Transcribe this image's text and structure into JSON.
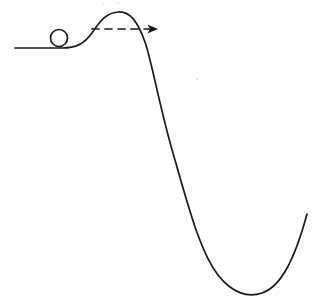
{
  "figure": {
    "title": "Ball rolling over a potential energy hill into a well",
    "background_color": "#ffffff",
    "ink_color": "#1a1a1a",
    "width": 319,
    "height": 303
  },
  "elements": {
    "ground_line": {
      "label": "flat ground",
      "start": [
        15,
        48
      ],
      "end": [
        62,
        48
      ],
      "stroke_width": 1.7
    },
    "terrain_curve": {
      "label": "hill and valley profile",
      "stroke_width": 1.7,
      "path": "M 15,48 L 62,48 C 76,48 84,44 92,33 C 100,21 106,13 118,12 C 130,11 138,22 145,42 C 152,62 160,110 175,160 C 188,205 200,252 218,275 C 232,293 248,298 262,293 C 280,287 294,262 307,214"
    },
    "ball": {
      "label": "ball",
      "center": [
        59,
        38
      ],
      "radius": 8.5,
      "stroke_width": 1.7,
      "fill": "#ffffff"
    },
    "motion_arrow": {
      "label": "direction of motion",
      "style": "dashed",
      "dash_pattern": "7 6",
      "start": [
        92,
        29
      ],
      "end": [
        163,
        29
      ],
      "stroke_width": 1.7,
      "arrowhead_size": 6
    },
    "peak": {
      "label": "hill crest",
      "point": [
        118,
        12
      ]
    },
    "valley": {
      "label": "valley floor",
      "point": [
        242,
        296
      ]
    },
    "specks": [
      {
        "x": 197,
        "y": 79,
        "r": 1.1
      },
      {
        "x": 103,
        "y": 4,
        "r": 0.9
      },
      {
        "x": 118,
        "y": 3,
        "r": 0.9
      }
    ]
  },
  "chart_data": {
    "type": "line",
    "title": "Ball rolling over a potential energy hill into a well",
    "xlabel": "",
    "ylabel": "",
    "grid": false,
    "legend": "none",
    "note": "Hand-drawn schematic: horizontal ground at left, a ball resting on the rising slope, a crest (barrier maximum), a steep descent, and a broad minimum (well) that rises again at the far right. A horizontal dashed arrow points rightward across the crest indicating the direction of travel.",
    "x": [
      15,
      62,
      92,
      118,
      145,
      175,
      218,
      242,
      262,
      307
    ],
    "y": [
      48,
      48,
      33,
      12,
      42,
      160,
      275,
      296,
      293,
      214
    ],
    "axis_note": "y measured downward in image pixels; visually lower y = higher elevation",
    "annotations": [
      {
        "text": "ball",
        "x": 59,
        "y": 38
      },
      {
        "text": "direction of motion",
        "x": 128,
        "y": 29
      },
      {
        "text": "crest",
        "x": 118,
        "y": 12
      },
      {
        "text": "well minimum",
        "x": 242,
        "y": 296
      }
    ]
  }
}
